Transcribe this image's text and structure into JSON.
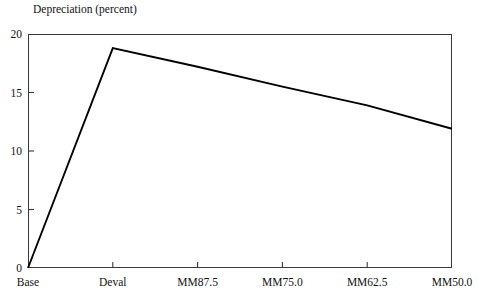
{
  "chart_data": {
    "type": "line",
    "title": "Depreciation (percent)",
    "xlabel": "",
    "ylabel": "",
    "categories": [
      "Base",
      "Deval",
      "MM87.5",
      "MM75.0",
      "MM62.5",
      "MM50.0"
    ],
    "values": [
      0,
      18.8,
      17.2,
      15.5,
      13.9,
      11.9
    ],
    "series": [
      {
        "name": "Depreciation",
        "values": [
          0,
          18.8,
          17.2,
          15.5,
          13.9,
          11.9
        ],
        "color": "#000000"
      }
    ],
    "ylim": [
      0,
      20
    ],
    "y_ticks": [
      0,
      5,
      10,
      15,
      20
    ],
    "y_tick_labels": [
      "0",
      "5",
      "10",
      "15",
      "20"
    ],
    "x_tick_labels": [
      "Base",
      "Deval",
      "MM87.5",
      "MM75.0",
      "MM62.5",
      "MM50.0"
    ],
    "grid": false,
    "legend": false,
    "legend_position": "none"
  },
  "chart": {
    "title": "Depreciation (percent)",
    "y_axis": {
      "ticks": [
        {
          "label": "20",
          "value": 20
        },
        {
          "label": "15",
          "value": 15
        },
        {
          "label": "10",
          "value": 10
        },
        {
          "label": "5",
          "value": 5
        },
        {
          "label": "0",
          "value": 0
        }
      ]
    },
    "x_axis": {
      "ticks": [
        {
          "label": "Base",
          "value": 0
        },
        {
          "label": "Deval",
          "value": 1
        },
        {
          "label": "MM87.5",
          "value": 2
        },
        {
          "label": "MM75.0",
          "value": 3
        },
        {
          "label": "MM62.5",
          "value": 4
        },
        {
          "label": "MM50.0",
          "value": 5
        }
      ]
    },
    "line_color": "#000000",
    "axis_color": "#3a3a3a"
  }
}
